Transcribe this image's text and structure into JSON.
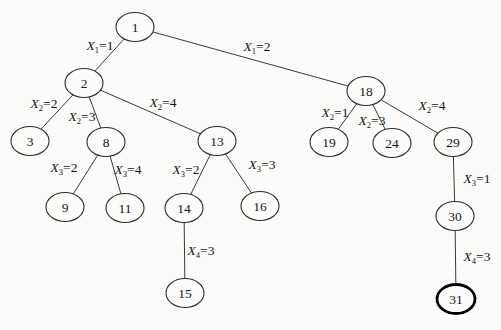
{
  "figure": {
    "kind": "search-tree-diagram",
    "width": 501,
    "height": 330
  },
  "colors": {
    "background": "#fbfbf9",
    "node_fill": "#fcfcfa",
    "stroke": "#2e2e2e",
    "edge_stroke": "#3a3a3a",
    "text": "#161616",
    "highlight_stroke": "#000000"
  },
  "tree": {
    "node_rx": 19,
    "node_ry": 14.5,
    "highlighted_node": "31",
    "nodes": [
      {
        "id": "1",
        "label": "1",
        "x": 135,
        "y": 27
      },
      {
        "id": "2",
        "label": "2",
        "x": 84,
        "y": 83
      },
      {
        "id": "18",
        "label": "18",
        "x": 366,
        "y": 91
      },
      {
        "id": "3",
        "label": "3",
        "x": 30,
        "y": 141
      },
      {
        "id": "8",
        "label": "8",
        "x": 106,
        "y": 142
      },
      {
        "id": "13",
        "label": "13",
        "x": 217,
        "y": 141
      },
      {
        "id": "19",
        "label": "19",
        "x": 329,
        "y": 142
      },
      {
        "id": "24",
        "label": "24",
        "x": 392,
        "y": 143
      },
      {
        "id": "29",
        "label": "29",
        "x": 453,
        "y": 142
      },
      {
        "id": "9",
        "label": "9",
        "x": 65,
        "y": 207
      },
      {
        "id": "11",
        "label": "11",
        "x": 125,
        "y": 208
      },
      {
        "id": "14",
        "label": "14",
        "x": 184,
        "y": 208
      },
      {
        "id": "16",
        "label": "16",
        "x": 260,
        "y": 206
      },
      {
        "id": "30",
        "label": "30",
        "x": 455,
        "y": 216
      },
      {
        "id": "15",
        "label": "15",
        "x": 185,
        "y": 293
      },
      {
        "id": "31",
        "label": "31",
        "x": 456,
        "y": 299
      }
    ],
    "edges": [
      {
        "from": "1",
        "to": "2",
        "var": "X",
        "sub": "1",
        "val": "1",
        "lx": 100,
        "ly": 45
      },
      {
        "from": "1",
        "to": "18",
        "var": "X",
        "sub": "1",
        "val": "2",
        "lx": 257,
        "ly": 46
      },
      {
        "from": "2",
        "to": "3",
        "var": "X",
        "sub": "2",
        "val": "2",
        "lx": 44,
        "ly": 103
      },
      {
        "from": "2",
        "to": "8",
        "var": "X",
        "sub": "2",
        "val": "3",
        "lx": 82,
        "ly": 116
      },
      {
        "from": "2",
        "to": "13",
        "var": "X",
        "sub": "2",
        "val": "4",
        "lx": 163,
        "ly": 102
      },
      {
        "from": "8",
        "to": "9",
        "var": "X",
        "sub": "3",
        "val": "2",
        "lx": 64,
        "ly": 167
      },
      {
        "from": "8",
        "to": "11",
        "var": "X",
        "sub": "3",
        "val": "4",
        "lx": 128,
        "ly": 169
      },
      {
        "from": "13",
        "to": "14",
        "var": "X",
        "sub": "3",
        "val": "2",
        "lx": 186,
        "ly": 169
      },
      {
        "from": "13",
        "to": "16",
        "var": "X",
        "sub": "3",
        "val": "3",
        "lx": 262,
        "ly": 164
      },
      {
        "from": "14",
        "to": "15",
        "var": "X",
        "sub": "4",
        "val": "3",
        "lx": 201,
        "ly": 250
      },
      {
        "from": "18",
        "to": "19",
        "var": "X",
        "sub": "2",
        "val": "1",
        "lx": 335,
        "ly": 112
      },
      {
        "from": "18",
        "to": "24",
        "var": "X",
        "sub": "2",
        "val": "3",
        "lx": 372,
        "ly": 120
      },
      {
        "from": "18",
        "to": "29",
        "var": "X",
        "sub": "2",
        "val": "4",
        "lx": 432,
        "ly": 105
      },
      {
        "from": "29",
        "to": "30",
        "var": "X",
        "sub": "3",
        "val": "1",
        "lx": 477,
        "ly": 178
      },
      {
        "from": "30",
        "to": "31",
        "var": "X",
        "sub": "4",
        "val": "3",
        "lx": 477,
        "ly": 256
      }
    ]
  }
}
